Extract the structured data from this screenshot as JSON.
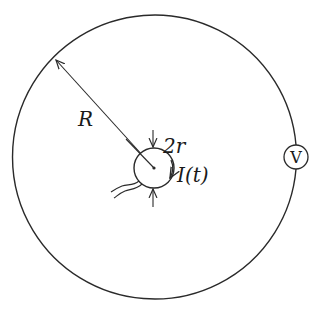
{
  "diagram": {
    "title": "",
    "labels": {
      "outer_radius": "R",
      "inner_diameter": "2r",
      "current": "I(t)",
      "voltmeter": "V"
    },
    "geometry": {
      "outer_circle": {
        "cx": 155,
        "cy": 157,
        "r": 142
      },
      "inner_circle": {
        "cx": 154,
        "cy": 168,
        "r": 20
      },
      "voltmeter": {
        "cx": 296,
        "cy": 157,
        "r": 12
      }
    },
    "colors": {
      "stroke": "#2a2a2a",
      "background": "#ffffff"
    },
    "elements": [
      "outer conducting ring of radius R",
      "inner wire loop of diameter 2r carrying current I(t)",
      "radius arrow labeled R",
      "dimension arrows labeled 2r",
      "voltmeter V in the outer ring",
      "twisted lead wires from inner loop"
    ]
  }
}
